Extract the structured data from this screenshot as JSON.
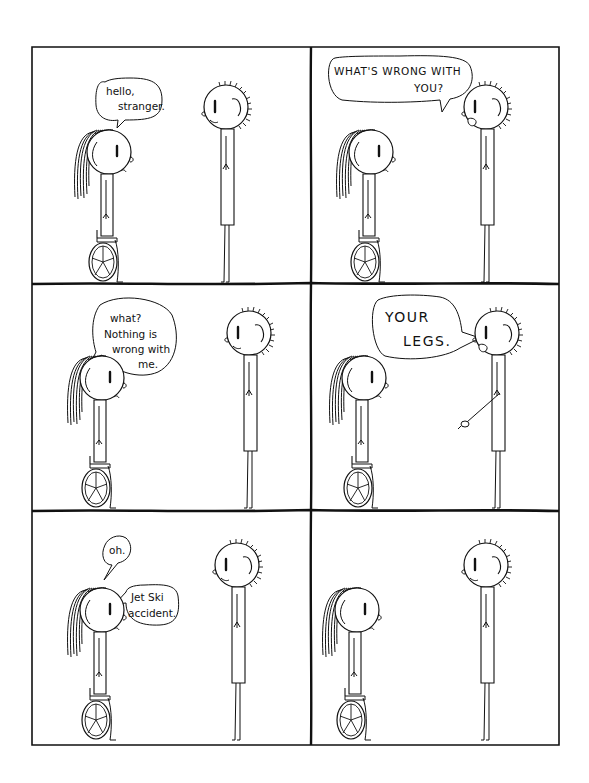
{
  "comic": {
    "layout": {
      "rows": 3,
      "cols": 2,
      "border_color": "#111111",
      "background": "#ffffff"
    },
    "characters": {
      "left": "girl-in-wheelchair",
      "right": "spiky-haired-boy"
    },
    "panels": [
      {
        "index": 1,
        "speaker": "girl",
        "bubble_lines": [
          "hello,",
          "stranger."
        ]
      },
      {
        "index": 2,
        "speaker": "boy",
        "bubble_lines": [
          "WHAT'S WRONG WITH",
          "YOU?"
        ]
      },
      {
        "index": 3,
        "speaker": "girl",
        "bubble_lines": [
          "what?",
          "Nothing is",
          "wrong with",
          "me."
        ]
      },
      {
        "index": 4,
        "speaker": "boy",
        "bubble_lines": [
          "YOUR",
          "LEGS."
        ]
      },
      {
        "index": 5,
        "speaker": "girl",
        "bubble_lines_a": [
          "oh."
        ],
        "bubble_lines_b": [
          "Jet Ski",
          "accident."
        ]
      },
      {
        "index": 6,
        "speaker": "none",
        "bubble_lines": []
      }
    ]
  }
}
